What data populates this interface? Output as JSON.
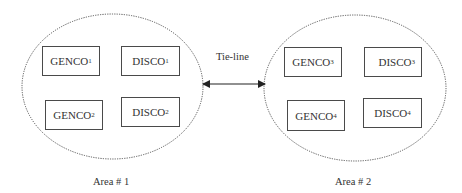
{
  "diagram": {
    "tie_line_label": "Tie-line",
    "areas": [
      {
        "label": "Area # 1",
        "units": [
          {
            "name": "GENCO",
            "sub": "1",
            "x": 42,
            "y": 46,
            "w": 58,
            "h": 30
          },
          {
            "name": "DISCO",
            "sub": "1",
            "x": 121,
            "y": 46,
            "w": 59,
            "h": 30
          },
          {
            "name": "GENCO",
            "sub": "2",
            "x": 45,
            "y": 100,
            "w": 58,
            "h": 30
          },
          {
            "name": "DISCO",
            "sub": "2",
            "x": 121,
            "y": 97,
            "w": 59,
            "h": 30
          }
        ]
      },
      {
        "label": "Area # 2",
        "units": [
          {
            "name": "GENCO",
            "sub": "3",
            "x": 284,
            "y": 47,
            "w": 58,
            "h": 30
          },
          {
            "name": "DISCO",
            "sub": "3",
            "x": 364,
            "y": 47,
            "w": 58,
            "h": 30
          },
          {
            "name": "GENCO",
            "sub": "4",
            "x": 287,
            "y": 100,
            "w": 58,
            "h": 31
          },
          {
            "name": "DISCO",
            "sub": "4",
            "x": 363,
            "y": 98,
            "w": 59,
            "h": 30
          }
        ]
      }
    ]
  }
}
